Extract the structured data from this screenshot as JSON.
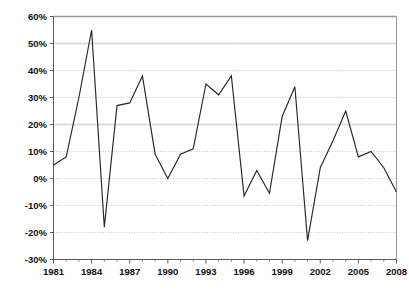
{
  "chart_data": {
    "type": "line",
    "title": "",
    "subtitle": "",
    "xlabel": "",
    "ylabel": "",
    "x": [
      1981,
      1982,
      1983,
      1984,
      1985,
      1986,
      1987,
      1988,
      1989,
      1990,
      1991,
      1992,
      1993,
      1994,
      1995,
      1996,
      1997,
      1998,
      1999,
      2000,
      2001,
      2002,
      2003,
      2004,
      2005,
      2006,
      2007,
      2008
    ],
    "values": [
      5,
      8,
      30,
      55,
      -18,
      27,
      28,
      38,
      9,
      0,
      9,
      11,
      35,
      31,
      38,
      -6.5,
      3,
      -5.5,
      23,
      34,
      -23,
      4,
      14,
      25,
      8,
      10,
      4,
      -5
    ],
    "series": [
      {
        "name": "series-1",
        "values": [
          5,
          8,
          30,
          55,
          -18,
          27,
          28,
          38,
          9,
          0,
          9,
          11,
          35,
          31,
          38,
          -6.5,
          3,
          -5.5,
          23,
          34,
          -23,
          4,
          14,
          25,
          8,
          10,
          4,
          -5
        ],
        "color": "#262626"
      }
    ],
    "xlim": [
      1981,
      2008
    ],
    "ylim": [
      -30,
      60
    ],
    "y_ticks": [
      -30,
      -20,
      -10,
      0,
      10,
      20,
      30,
      40,
      50,
      60
    ],
    "y_tick_labels": [
      "-30%",
      "-20%",
      "-10%",
      "0%",
      "10%",
      "20%",
      "30%",
      "40%",
      "50%",
      "60%"
    ],
    "x_ticks": [
      1981,
      1984,
      1987,
      1990,
      1993,
      1996,
      1999,
      2002,
      2005,
      2008
    ],
    "x_tick_labels": [
      "1981",
      "1984",
      "1987",
      "1990",
      "1993",
      "1996",
      "1999",
      "2002",
      "2005",
      "2008"
    ],
    "grid": true,
    "grid_axis": "y",
    "legend": false,
    "legend_position": "none",
    "annotations": [],
    "unit": "%"
  },
  "figure": {
    "caption": "",
    "background_color": "#ffffff",
    "line_color": "#262626",
    "grid_color": "#b9b9b9",
    "axis_color": "#5a5a5a",
    "text_color": "#111111"
  }
}
